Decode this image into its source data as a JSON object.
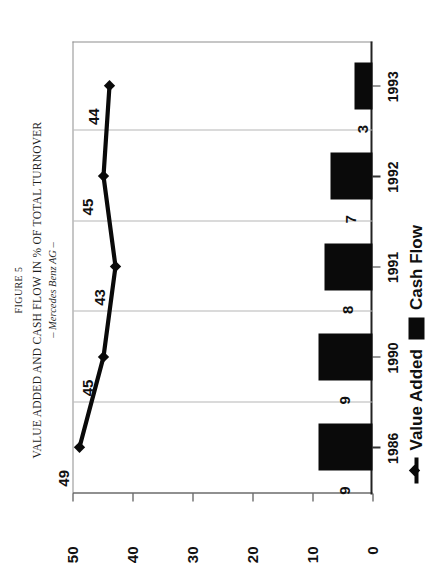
{
  "figure": {
    "label": "FIGURE 5",
    "title": "VALUE ADDED AND CASH FLOW IN % OF TOTAL TURNOVER",
    "subtitle": "– Mercedes Benz AG –"
  },
  "legend": {
    "value_added_label": "Value Added",
    "cash_flow_label": "Cash Flow",
    "line_icon": "line-marker-icon",
    "bar_icon": "filled-square-icon"
  },
  "chart_data": {
    "type": "bar",
    "title": "VALUE ADDED AND CASH FLOW IN % OF TOTAL TURNOVER",
    "subtitle": "– Mercedes Benz AG –",
    "xlabel": "",
    "ylabel": "",
    "categories": [
      "1986",
      "1990",
      "1991",
      "1992",
      "1993"
    ],
    "ylim": [
      0,
      50
    ],
    "yticks": [
      0,
      10,
      20,
      30,
      40,
      50
    ],
    "ytick_labels": [
      "0",
      "10",
      "20",
      "30",
      "40",
      "50"
    ],
    "grid": "vertical-category-separators",
    "legend_position": "bottom-left",
    "series": [
      {
        "name": "Value Added",
        "type": "line",
        "values": [
          49,
          45,
          43,
          45,
          44
        ],
        "labels": [
          "49",
          "45",
          "43",
          "45",
          "44"
        ],
        "color": "#0a0a0a",
        "marker": "diamond"
      },
      {
        "name": "Cash Flow",
        "type": "bar",
        "values": [
          9,
          9,
          8,
          7,
          3
        ],
        "labels": [
          "9",
          "9",
          "8",
          "7",
          "3"
        ],
        "color": "#0a0a0a"
      }
    ]
  }
}
